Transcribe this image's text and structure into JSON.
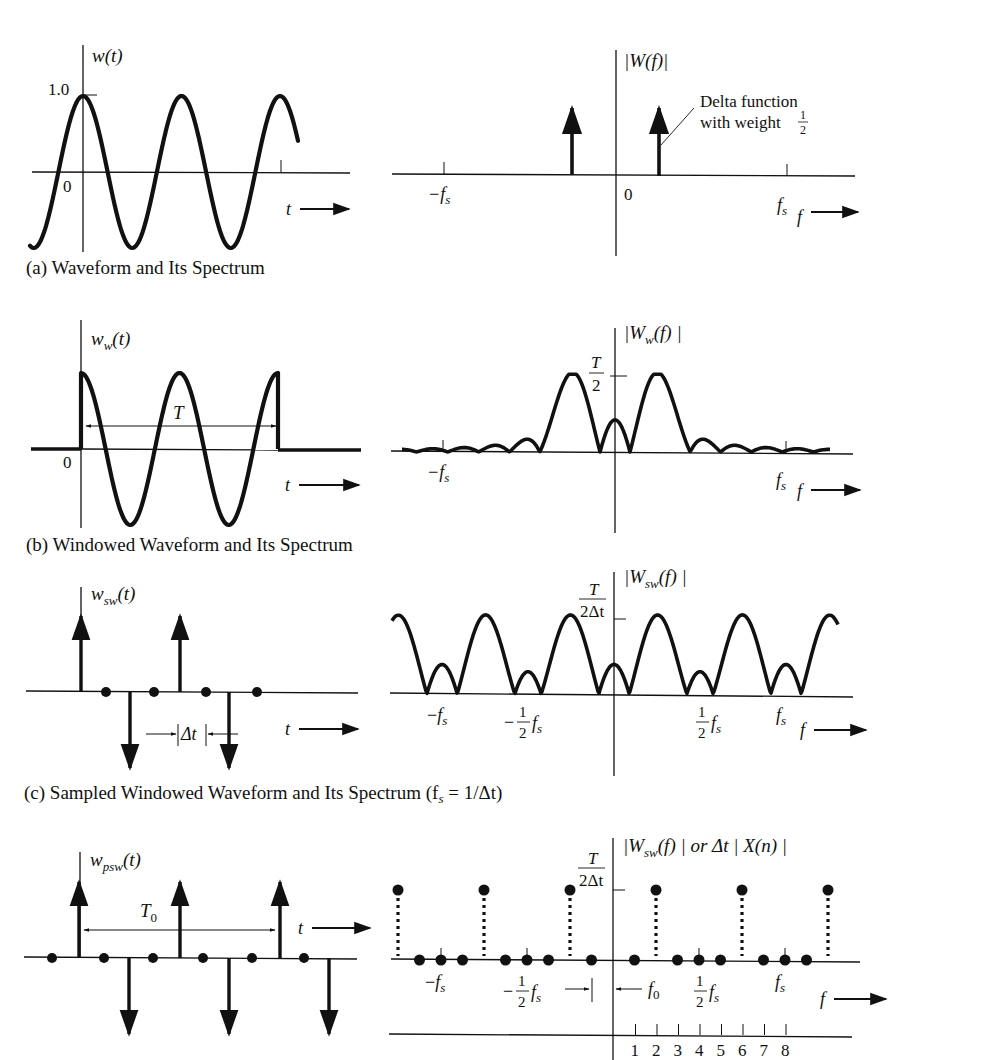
{
  "figure": {
    "panels": [
      {
        "id": "a",
        "caption": "(a) Waveform and Its Spectrum",
        "time_plot": {
          "ylabel": "w(t)",
          "ytick": "1.0",
          "origin": "0",
          "xlabel": "t"
        },
        "freq_plot": {
          "ylabel": "|W(f)|",
          "ticks": [
            "−f",
            "0",
            "f"
          ],
          "tick_subscripts": [
            "s",
            "",
            "s"
          ],
          "xlabel": "f",
          "annotation_line1": "Delta function",
          "annotation_line2": "with weight",
          "annotation_frac_num": "1",
          "annotation_frac_den": "2"
        }
      },
      {
        "id": "b",
        "caption": "(b) Windowed Waveform and Its Spectrum",
        "time_plot": {
          "ylabel_main": "w",
          "ylabel_sub": "w",
          "ylabel_arg": "(t)",
          "origin": "0",
          "window_label": "T",
          "xlabel": "t"
        },
        "freq_plot": {
          "ylabel_main": "|W",
          "ylabel_sub": "w",
          "ylabel_rest": "(f) |",
          "peak_num": "T",
          "peak_den": "2",
          "ticks": [
            "−f",
            "f"
          ],
          "tick_subscripts": [
            "s",
            "s"
          ],
          "xlabel": "f"
        }
      },
      {
        "id": "c",
        "caption": "(c) Sampled Windowed Waveform and Its Spectrum (f",
        "caption_sub": "s",
        "caption_rest": " = 1/Δt)",
        "time_plot": {
          "ylabel_main": "w",
          "ylabel_sub": "sw",
          "ylabel_arg": "(t)",
          "spacing_label": "Δt",
          "xlabel": "t"
        },
        "freq_plot": {
          "ylabel_main": "|W",
          "ylabel_sub": "sw",
          "ylabel_rest": "(f) |",
          "peak_num": "T",
          "peak_den": "2Δt",
          "half_num": "1",
          "half_den": "2",
          "neg_sign": "−",
          "f_main": "f",
          "f_sub": "s",
          "xlabel": "f"
        }
      },
      {
        "id": "d",
        "time_plot": {
          "ylabel_main": "w",
          "ylabel_sub": "psw",
          "ylabel_arg": "(t)",
          "period_main": "T",
          "period_sub": "0",
          "xlabel": "t"
        },
        "freq_plot": {
          "ylabel_main": "|W",
          "ylabel_sub": "sw",
          "ylabel_rest": "(f) | or Δt | X(n) |",
          "peak_num": "T",
          "peak_den": "2Δt",
          "f0_main": "f",
          "f0_sub": "0",
          "half_num": "1",
          "half_den": "2",
          "neg_sign": "−",
          "f_main": "f",
          "f_sub": "s",
          "xlabel": "f",
          "index_ticks": [
            "1",
            "2",
            "3",
            "4",
            "5",
            "6",
            "7",
            "8"
          ]
        }
      }
    ]
  },
  "chart_data": [
    {
      "type": "line",
      "title": "w(t)",
      "description": "Continuous cosine waveform, amplitude 1.0",
      "xlabel": "t",
      "ylabel": "w(t)",
      "ylim": [
        -1.0,
        1.0
      ],
      "y_ticks": [
        "1.0",
        "0"
      ]
    },
    {
      "type": "bar",
      "title": "|W(f)|",
      "description": "Two delta functions of weight 1/2 at ±f0",
      "x_ticks": [
        "-fs",
        "0",
        "fs"
      ],
      "impulses": [
        {
          "x": "-f0",
          "weight": 0.5
        },
        {
          "x": "+f0",
          "weight": 0.5
        }
      ],
      "xlabel": "f",
      "annotation": "Delta function with weight 1/2"
    },
    {
      "type": "line",
      "title": "w_w(t)",
      "description": "Cosine truncated by rectangular window of length T starting at 0",
      "xlabel": "t",
      "annotations": [
        "T"
      ]
    },
    {
      "type": "line",
      "title": "|W_w(f)|",
      "description": "Sinc-shaped main lobes centered at ±f0 with peak T/2 and decaying sidelobes",
      "x_ticks": [
        "-fs",
        "fs"
      ],
      "y_ticks": [
        "T/2"
      ],
      "xlabel": "f"
    },
    {
      "type": "bar",
      "title": "w_sw(t)",
      "description": "Sampled windowed waveform: impulses +1, 0, -1, 0, +1, 0, -1, 0 at spacing Δt",
      "values": [
        1,
        0,
        -1,
        0,
        1,
        0,
        -1,
        0
      ],
      "xlabel": "t",
      "annotations": [
        "Δt"
      ]
    },
    {
      "type": "line",
      "title": "|W_sw(f)|",
      "description": "Periodic repetition of windowed spectrum with period fs, peak T/(2Δt)",
      "x_ticks": [
        "-fs",
        "-1/2 fs",
        "1/2 fs",
        "fs"
      ],
      "y_ticks": [
        "T/(2Δt)"
      ],
      "xlabel": "f"
    },
    {
      "type": "bar",
      "title": "w_psw(t)",
      "description": "Periodic sampled windowed waveform with period T0",
      "values": [
        0,
        1,
        0,
        -1,
        0,
        1,
        0,
        -1,
        0,
        1,
        0,
        -1
      ],
      "xlabel": "t",
      "annotations": [
        "T0"
      ]
    },
    {
      "type": "scatter",
      "title": "|W_sw(f)| or Δt |X(n)|",
      "description": "Discrete spectrum samples at spacing f0; nonzero samples of height T/(2Δt) at n=2 and n=6 (and periodic images)",
      "x_ticks": [
        "-fs",
        "-1/2 fs",
        "f0",
        "1/2 fs",
        "fs"
      ],
      "n_ticks": [
        1,
        2,
        3,
        4,
        5,
        6,
        7,
        8
      ],
      "nonzero_n": [
        2,
        6
      ],
      "y_ticks": [
        "T/(2Δt)"
      ],
      "xlabel": "f"
    }
  ]
}
